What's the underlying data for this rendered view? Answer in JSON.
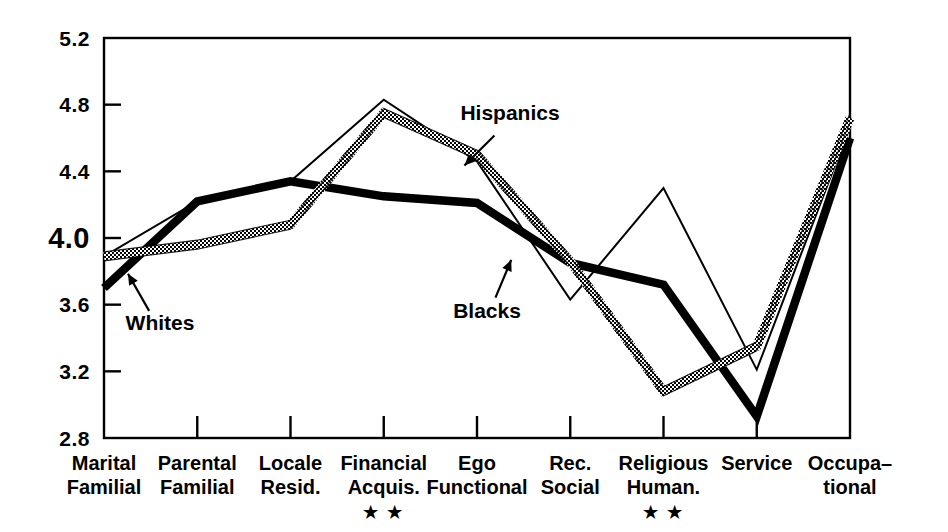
{
  "chart_data": {
    "type": "line",
    "title": "",
    "subtitle": "",
    "xlabel": "",
    "ylabel": "",
    "ylim": [
      2.8,
      5.2
    ],
    "yticks": [
      2.8,
      3.2,
      3.6,
      4.0,
      4.4,
      4.8,
      5.2
    ],
    "ytick_labels": [
      "2.8",
      "3.2",
      "3.6",
      "4.0",
      "4.4",
      "4.8",
      "5.2"
    ],
    "emphasized_ytick": "4.0",
    "grid": false,
    "legend_position": "inline-annotations",
    "categories": [
      "Marital Familial",
      "Parental Familial",
      "Locale Resid.",
      "Financial Acquis.",
      "Ego Functional",
      "Rec. Social",
      "Religious Human.",
      "Service",
      "Occupa- tional"
    ],
    "category_lines": [
      [
        "Marital",
        "Familial"
      ],
      [
        "Parental",
        "Familial"
      ],
      [
        "Locale",
        "Resid."
      ],
      [
        "Financial",
        "Acquis."
      ],
      [
        "Ego",
        "Functional"
      ],
      [
        "Rec.",
        "Social"
      ],
      [
        "Religious",
        "Human."
      ],
      [
        "Service",
        ""
      ],
      [
        "Occupa–",
        "tional"
      ]
    ],
    "significance_marks": [
      {
        "category": "Financial Acquis.",
        "index": 3,
        "mark": "★ ★"
      },
      {
        "category": "Religious Human.",
        "index": 6,
        "mark": "★ ★"
      }
    ],
    "series": [
      {
        "name": "Whites",
        "style": "thick-solid-black",
        "color": "#000000",
        "values": [
          3.7,
          4.22,
          4.34,
          4.25,
          4.21,
          3.85,
          3.72,
          2.93,
          4.6
        ]
      },
      {
        "name": "Blacks",
        "style": "thin-solid-black",
        "color": "#000000",
        "values": [
          3.89,
          4.22,
          4.34,
          4.83,
          4.46,
          3.63,
          4.3,
          3.21,
          4.67
        ]
      },
      {
        "name": "Hispanics",
        "style": "hatched-outline",
        "color": "#000000",
        "values": [
          3.89,
          3.96,
          4.08,
          4.75,
          4.5,
          3.86,
          3.08,
          3.35,
          4.72
        ]
      }
    ],
    "annotations": [
      {
        "label": "Whites",
        "label_x": 160,
        "label_y": 330,
        "tip_x": 127,
        "tip_y": 272
      },
      {
        "label": "Blacks",
        "label_x": 487,
        "label_y": 318,
        "tip_x": 512,
        "tip_y": 258
      },
      {
        "label": "Hispanics",
        "label_x": 510,
        "label_y": 120,
        "tip_x": 463,
        "tip_y": 167
      }
    ]
  },
  "plot": {
    "left": 104,
    "right": 850,
    "top": 38,
    "bottom": 438
  }
}
